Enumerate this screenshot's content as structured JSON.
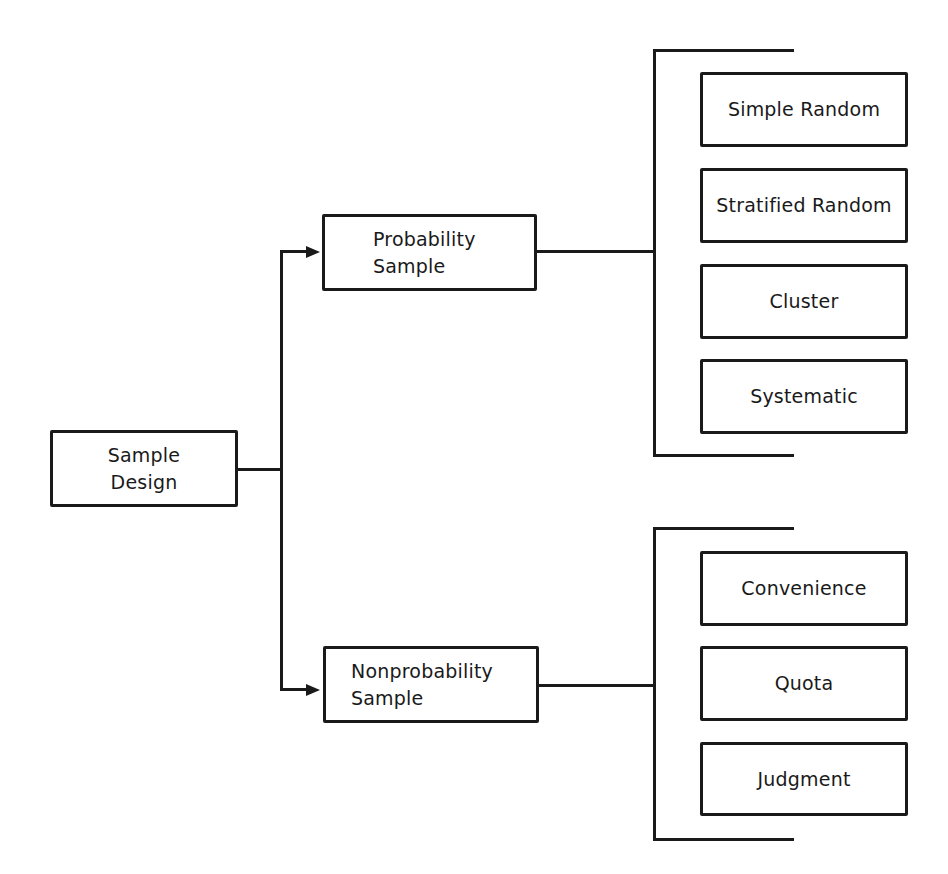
{
  "diagram": {
    "type": "hierarchy",
    "root": {
      "label_line1": "Sample",
      "label_line2": "Design"
    },
    "branches": [
      {
        "label_line1": "Probability",
        "label_line2": "Sample",
        "children": [
          "Simple Random",
          "Stratified Random",
          "Cluster",
          "Systematic"
        ]
      },
      {
        "label_line1": "Nonprobability",
        "label_line2": "Sample",
        "children": [
          "Convenience",
          "Quota",
          "Judgment"
        ]
      }
    ],
    "colors": {
      "line": "#1a1a1a",
      "background": "#ffffff"
    }
  }
}
